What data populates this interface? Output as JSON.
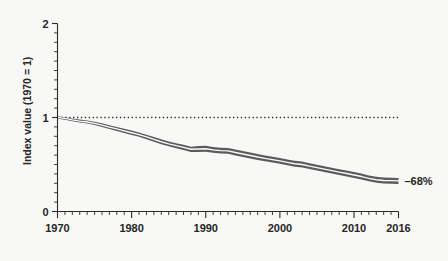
{
  "chart_data": {
    "type": "line",
    "title": "",
    "subtitle": "",
    "xlabel": "",
    "ylabel": "Index value (1970 = 1)",
    "xlim": [
      1970,
      2016
    ],
    "ylim": [
      0,
      2
    ],
    "grid": false,
    "legend": null,
    "x_tick_labels": [
      "1970",
      "1980",
      "1990",
      "2000",
      "2010",
      "2016"
    ],
    "x_tick_values": [
      1970,
      1980,
      1990,
      2000,
      2010,
      2016
    ],
    "x_minor_tick_step": 1,
    "y_tick_labels": [
      "0",
      "1",
      "2"
    ],
    "y_tick_values": [
      0,
      1,
      2
    ],
    "y_minor_tick_step": 0.1,
    "reference_line": {
      "value": 1,
      "style": "dotted",
      "label": ""
    },
    "annotations": [
      {
        "text": "–68%",
        "x": 2016,
        "y": 0.32,
        "position": "right-of-line-end"
      }
    ],
    "colors": {
      "band": "#5a5b5d",
      "center_line": "#fbfbfa",
      "axis": "#2b2b2b",
      "text": "#262626",
      "background": "#f8f8f6"
    },
    "x": [
      1970,
      1971,
      1972,
      1973,
      1974,
      1975,
      1976,
      1977,
      1978,
      1979,
      1980,
      1981,
      1982,
      1983,
      1984,
      1985,
      1986,
      1987,
      1988,
      1989,
      1990,
      1991,
      1992,
      1993,
      1994,
      1995,
      1996,
      1997,
      1998,
      1999,
      2000,
      2001,
      2002,
      2003,
      2004,
      2005,
      2006,
      2007,
      2008,
      2009,
      2010,
      2011,
      2012,
      2013,
      2014,
      2015,
      2016
    ],
    "series": [
      {
        "name": "Index value",
        "kind": "line-with-uncertainty-band",
        "values": [
          1.0,
          0.99,
          0.975,
          0.962,
          0.952,
          0.938,
          0.918,
          0.898,
          0.878,
          0.858,
          0.838,
          0.818,
          0.793,
          0.768,
          0.742,
          0.72,
          0.7,
          0.682,
          0.662,
          0.665,
          0.668,
          0.655,
          0.648,
          0.645,
          0.628,
          0.612,
          0.596,
          0.58,
          0.566,
          0.552,
          0.538,
          0.522,
          0.508,
          0.5,
          0.482,
          0.466,
          0.45,
          0.434,
          0.418,
          0.404,
          0.388,
          0.372,
          0.352,
          0.338,
          0.33,
          0.328,
          0.325
        ],
        "band_upper": [
          1.012,
          1.003,
          0.99,
          0.978,
          0.969,
          0.956,
          0.938,
          0.918,
          0.899,
          0.88,
          0.861,
          0.841,
          0.817,
          0.793,
          0.768,
          0.746,
          0.727,
          0.71,
          0.69,
          0.696,
          0.7,
          0.686,
          0.679,
          0.676,
          0.659,
          0.643,
          0.627,
          0.611,
          0.597,
          0.583,
          0.569,
          0.553,
          0.539,
          0.531,
          0.513,
          0.497,
          0.481,
          0.465,
          0.449,
          0.435,
          0.419,
          0.403,
          0.383,
          0.369,
          0.362,
          0.36,
          0.357
        ],
        "band_lower": [
          0.988,
          0.977,
          0.96,
          0.946,
          0.935,
          0.92,
          0.898,
          0.878,
          0.857,
          0.836,
          0.815,
          0.795,
          0.769,
          0.743,
          0.716,
          0.694,
          0.673,
          0.654,
          0.634,
          0.634,
          0.636,
          0.624,
          0.617,
          0.614,
          0.597,
          0.581,
          0.565,
          0.549,
          0.535,
          0.521,
          0.507,
          0.491,
          0.477,
          0.469,
          0.451,
          0.435,
          0.419,
          0.403,
          0.387,
          0.373,
          0.357,
          0.341,
          0.321,
          0.307,
          0.298,
          0.296,
          0.293
        ]
      }
    ]
  }
}
